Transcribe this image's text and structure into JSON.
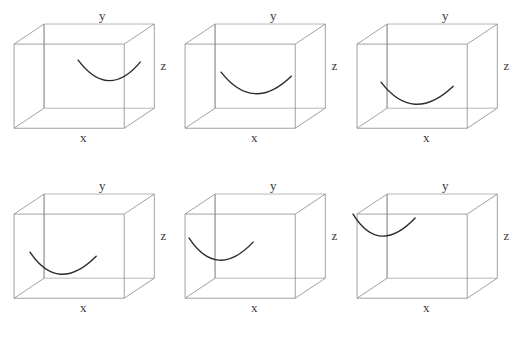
{
  "figure": {
    "title": "",
    "type": "wireframe-cube-grid",
    "background_color": "#ffffff",
    "edge_color": "#8a8a8f",
    "hidden_edge_color": "#a8a8ad",
    "curve_color": "#2b2b2b",
    "label_color": "#3a3a3a",
    "rows": 2,
    "columns": 3,
    "panel_count": 6
  },
  "axis_labels": {
    "x": "x",
    "y": "y",
    "z": "z"
  },
  "panels": [
    {
      "id": "panel-1",
      "position": "row-1-col-1",
      "labels": {
        "x": "x",
        "y": "y",
        "z": "z"
      },
      "curve": {
        "description": "parabolic arc on right face, upper area",
        "start": [
          78,
          60
        ],
        "control": [
          108,
          100
        ],
        "end": [
          140,
          62
        ],
        "shape": "parabola-opening-up"
      }
    },
    {
      "id": "panel-2",
      "position": "row-1-col-2",
      "labels": {
        "x": "x",
        "y": "y",
        "z": "z"
      },
      "curve": {
        "description": "parabolic arc centered, lower middle area",
        "start": [
          50,
          72
        ],
        "control": [
          82,
          113
        ],
        "end": [
          120,
          76
        ],
        "shape": "parabola-opening-up"
      }
    },
    {
      "id": "panel-3",
      "position": "row-1-col-3",
      "labels": {
        "x": "x",
        "y": "y",
        "z": "z"
      },
      "curve": {
        "description": "parabolic arc shifted left, low area near floor",
        "start": [
          38,
          82
        ],
        "control": [
          70,
          124
        ],
        "end": [
          110,
          86
        ],
        "shape": "parabola-opening-up"
      }
    },
    {
      "id": "panel-4",
      "position": "row-2-col-1",
      "labels": {
        "x": "x",
        "y": "y",
        "z": "z"
      },
      "curve": {
        "description": "parabolic arc in lower-left region",
        "start": [
          30,
          82
        ],
        "control": [
          58,
          124
        ],
        "end": [
          96,
          86
        ],
        "shape": "parabola-opening-up"
      }
    },
    {
      "id": "panel-5",
      "position": "row-2-col-2",
      "labels": {
        "x": "x",
        "y": "y",
        "z": "z"
      },
      "curve": {
        "description": "parabolic arc on left face, mid height",
        "start": [
          18,
          68
        ],
        "control": [
          46,
          110
        ],
        "end": [
          82,
          72
        ],
        "shape": "parabola-opening-up"
      }
    },
    {
      "id": "panel-6",
      "position": "row-2-col-3",
      "labels": {
        "x": "x",
        "y": "y",
        "z": "z"
      },
      "curve": {
        "description": "parabolic arc on upper-left face near top edge",
        "start": [
          10,
          44
        ],
        "control": [
          36,
          86
        ],
        "end": [
          72,
          48
        ],
        "shape": "parabola-opening-up"
      }
    }
  ],
  "cube_geometry": {
    "description": "wireframe cube in oblique projection",
    "front_top_left": [
      14,
      44
    ],
    "front_top_right": [
      124,
      44
    ],
    "front_bottom_left": [
      14,
      128
    ],
    "front_bottom_right": [
      124,
      128
    ],
    "back_top_left": [
      44,
      24
    ],
    "back_top_right": [
      154,
      24
    ],
    "back_bottom_left": [
      44,
      108
    ],
    "back_bottom_right": [
      154,
      108
    ]
  }
}
